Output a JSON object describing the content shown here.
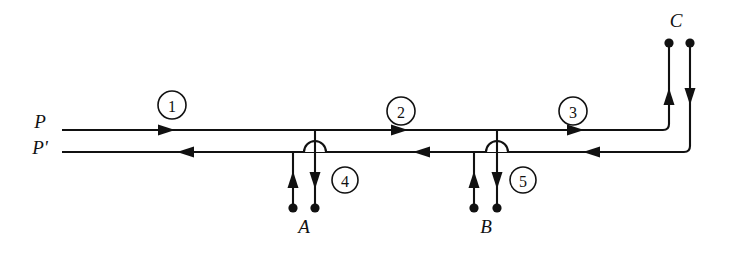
{
  "diagram": {
    "ink_color": "#111111",
    "background_color": "#ffffff",
    "ports": [
      {
        "id": "P",
        "label": "P",
        "x": 44,
        "y": 128
      },
      {
        "id": "Pp",
        "label": "P'",
        "x": 42,
        "y": 152
      },
      {
        "id": "C",
        "label": "C",
        "x": 676,
        "y": 30
      },
      {
        "id": "A",
        "label": "A",
        "x": 304,
        "y": 228
      },
      {
        "id": "B",
        "label": "B",
        "x": 486,
        "y": 228
      }
    ],
    "segments": [
      {
        "id": "seg1",
        "label": "1",
        "cx": 172,
        "cy": 105,
        "r": 14
      },
      {
        "id": "seg2",
        "label": "2",
        "cx": 401,
        "cy": 111,
        "r": 14
      },
      {
        "id": "seg3",
        "label": "3",
        "cx": 573,
        "cy": 111,
        "r": 14
      },
      {
        "id": "seg4",
        "label": "4",
        "cx": 345,
        "cy": 180,
        "r": 13
      },
      {
        "id": "seg5",
        "label": "5",
        "cx": 523,
        "cy": 180,
        "r": 13
      }
    ],
    "lines": {
      "upper_conductor_y": 130,
      "lower_conductor_y": 152,
      "left_start_x": 62,
      "upper_turn_x": 669,
      "lower_turn_x": 690,
      "top_terminal_y": 43
    },
    "terminals": [
      {
        "id": "c-left-dot",
        "x": 669,
        "y": 43
      },
      {
        "id": "c-right-dot",
        "x": 690,
        "y": 43
      },
      {
        "id": "a-left-dot",
        "x": 293,
        "y": 208
      },
      {
        "id": "a-right-dot",
        "x": 315,
        "y": 208
      },
      {
        "id": "b-left-dot",
        "x": 474,
        "y": 208
      },
      {
        "id": "b-right-dot",
        "x": 497,
        "y": 208
      }
    ],
    "flow_arrows": [
      {
        "id": "seg1-upper",
        "direction": "right",
        "x": 172,
        "y": 130
      },
      {
        "id": "seg1-lower",
        "direction": "left",
        "x": 180,
        "y": 152
      },
      {
        "id": "seg2-upper",
        "direction": "right",
        "x": 405,
        "y": 130
      },
      {
        "id": "seg2-lower",
        "direction": "left",
        "x": 416,
        "y": 152
      },
      {
        "id": "seg3-upper",
        "direction": "right",
        "x": 581,
        "y": 130
      },
      {
        "id": "seg3-lower",
        "direction": "left",
        "x": 586,
        "y": 152
      },
      {
        "id": "c-left-up",
        "direction": "up",
        "x": 669,
        "y": 96
      },
      {
        "id": "c-right-down",
        "direction": "down",
        "x": 690,
        "y": 96
      },
      {
        "id": "a-left-up",
        "direction": "up",
        "x": 293,
        "y": 178
      },
      {
        "id": "a-right-down",
        "direction": "down",
        "x": 315,
        "y": 180
      },
      {
        "id": "b-left-up",
        "direction": "up",
        "x": 474,
        "y": 178
      },
      {
        "id": "b-right-down",
        "direction": "down",
        "x": 497,
        "y": 180
      }
    ],
    "branches": [
      {
        "id": "branch-a",
        "tap_x": 315,
        "hop_x": 315,
        "stub_x": 293
      },
      {
        "id": "branch-b",
        "tap_x": 497,
        "hop_x": 497,
        "stub_x": 474
      }
    ]
  }
}
